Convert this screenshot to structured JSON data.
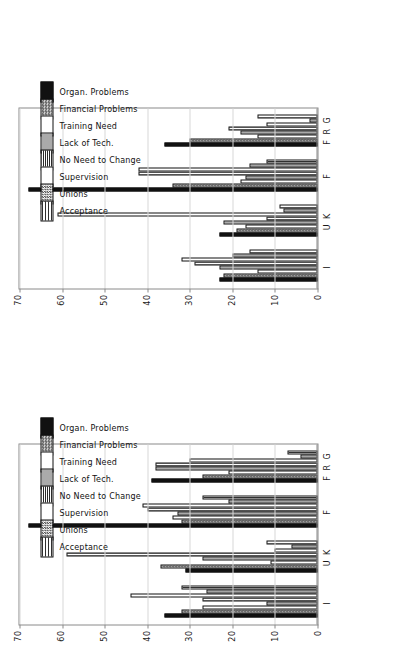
{
  "page": {
    "orientation_deg": -90,
    "background": "#ffffff",
    "chart_count": 2
  },
  "legend": {
    "position": "right-of-plot",
    "entries": [
      {
        "label": "Organ. Problems",
        "pattern": "solid-black",
        "swatch": "p-solid"
      },
      {
        "label": "Financial Problems",
        "pattern": "checker-medium",
        "swatch": "p-check"
      },
      {
        "label": "Training Need",
        "pattern": "white",
        "swatch": "p-white"
      },
      {
        "label": "Lack of Tech.",
        "pattern": "checker-dark",
        "swatch": "p-check2"
      },
      {
        "label": "No Need to Change",
        "pattern": "vertical-fine",
        "swatch": "p-vfine"
      },
      {
        "label": "Supervision",
        "pattern": "open-outline",
        "swatch": "p-open"
      },
      {
        "label": "Unions",
        "pattern": "checker-dense",
        "swatch": "p-check3"
      },
      {
        "label": "Acceptance",
        "pattern": "vertical-lines",
        "swatch": "p-vert"
      }
    ]
  },
  "chart_data": [
    {
      "id": "chart-left",
      "type": "bar",
      "title": "",
      "xlabel": "",
      "ylabel": "",
      "ylim": [
        0,
        70
      ],
      "yticks": [
        70,
        60,
        50,
        40,
        30,
        20,
        10,
        0
      ],
      "grid": true,
      "legend_position": "right",
      "categories": [
        "I",
        "U K",
        "F",
        "F R G"
      ],
      "series": [
        {
          "name": "Organ. Problems",
          "values": [
            36,
            31,
            68,
            39
          ]
        },
        {
          "name": "Financial Problems",
          "values": [
            32,
            37,
            32,
            27
          ]
        },
        {
          "name": "Training Need",
          "values": [
            27,
            11,
            34,
            21
          ]
        },
        {
          "name": "Lack of Tech.",
          "values": [
            12,
            27,
            33,
            38
          ]
        },
        {
          "name": "No Need to Change",
          "values": [
            27,
            59,
            40,
            38
          ]
        },
        {
          "name": "Supervision",
          "values": [
            44,
            10,
            41,
            30
          ]
        },
        {
          "name": "Unions",
          "values": [
            26,
            6,
            21,
            4
          ]
        },
        {
          "name": "Acceptance",
          "values": [
            32,
            12,
            27,
            7
          ]
        }
      ]
    },
    {
      "id": "chart-right",
      "type": "bar",
      "title": "",
      "xlabel": "",
      "ylabel": "",
      "ylim": [
        0,
        70
      ],
      "yticks": [
        70,
        60,
        50,
        40,
        30,
        20,
        10,
        0
      ],
      "grid": true,
      "legend_position": "right",
      "categories": [
        "I",
        "U K",
        "F",
        "F R G"
      ],
      "series": [
        {
          "name": "Organ. Problems",
          "values": [
            23,
            23,
            68,
            36
          ]
        },
        {
          "name": "Financial Problems",
          "values": [
            22,
            19,
            34,
            30
          ]
        },
        {
          "name": "Training Need",
          "values": [
            14,
            17,
            18,
            14
          ]
        },
        {
          "name": "Lack of Tech.",
          "values": [
            23,
            22,
            17,
            18
          ]
        },
        {
          "name": "No Need to Change",
          "values": [
            29,
            12,
            42,
            21
          ]
        },
        {
          "name": "Supervision",
          "values": [
            32,
            61,
            42,
            12
          ]
        },
        {
          "name": "Unions",
          "values": [
            20,
            8,
            16,
            2
          ]
        },
        {
          "name": "Acceptance",
          "values": [
            16,
            9,
            12,
            14
          ]
        }
      ]
    }
  ]
}
